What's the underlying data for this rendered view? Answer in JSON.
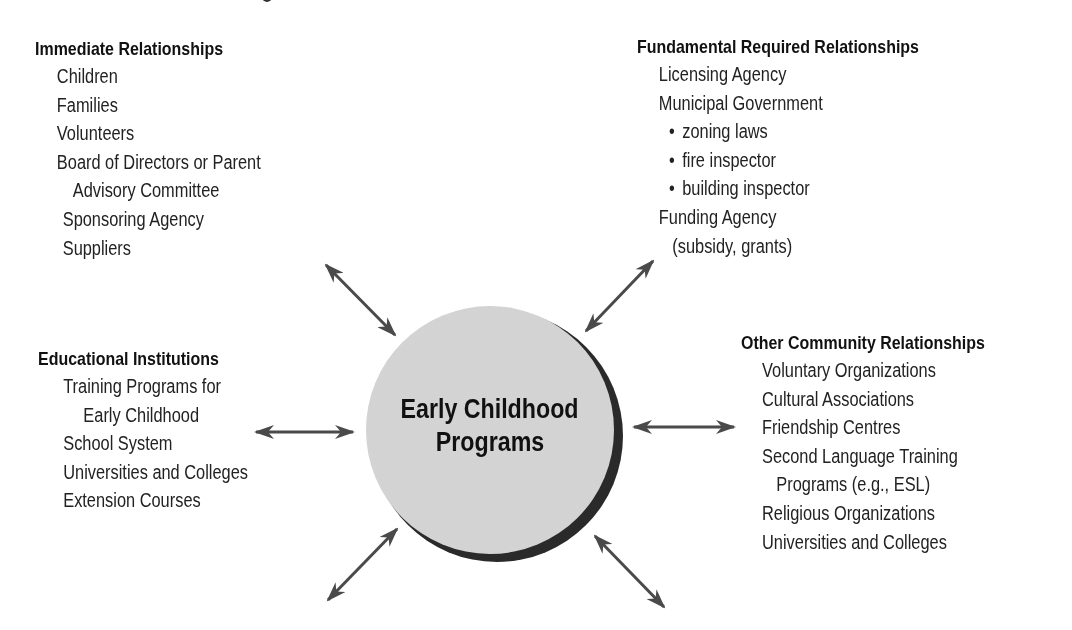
{
  "center": {
    "line1": "Early Childhood",
    "line2": "Programs"
  },
  "groups": {
    "immediate": {
      "heading": "Immediate Relationships",
      "items": [
        "Children",
        "Families",
        "Volunteers",
        "Board of Directors or Parent",
        "Advisory Committee",
        "Sponsoring Agency",
        "Suppliers"
      ]
    },
    "fundamental": {
      "heading": "Fundamental Required Relationships",
      "items": [
        "Licensing Agency",
        "Municipal Government",
        "zoning laws",
        "fire inspector",
        "building inspector",
        "Funding Agency",
        "(subsidy, grants)"
      ]
    },
    "educational": {
      "heading": "Educational Institutions",
      "items": [
        "Training Programs for",
        "Early Childhood",
        "School System",
        "Universities and Colleges",
        "Extension Courses"
      ]
    },
    "community": {
      "heading": "Other Community Relationships",
      "items": [
        "Voluntary Organizations",
        "Cultural Associations",
        "Friendship Centres",
        "Second Language Training",
        "Programs (e.g., ESL)",
        "Religious Organizations",
        "Universities and Colleges"
      ]
    }
  },
  "colors": {
    "circle_fill": "#d4d4d4",
    "circle_shadow": "#2a2a2a",
    "arrow": "#4a4a4a",
    "text": "#1a1a1a"
  }
}
